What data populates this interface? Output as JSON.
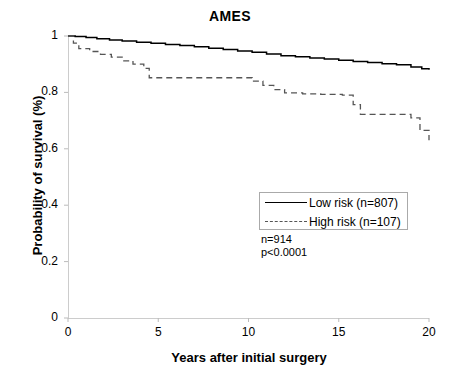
{
  "chart_data": {
    "type": "line",
    "title": "AMES",
    "xlabel": "Years after initial surgery",
    "ylabel": "Probability of survival (%)",
    "xlim": [
      0,
      20
    ],
    "ylim": [
      0,
      1
    ],
    "grid": false,
    "legend_position": "center-right",
    "xticks": [
      "0",
      "5",
      "10",
      "15",
      "20"
    ],
    "xtick_values": [
      0,
      5,
      10,
      15,
      20
    ],
    "yticks": [
      "0",
      "0.2",
      "0.4",
      "0.6",
      "0.8",
      "1"
    ],
    "ytick_values": [
      0,
      0.2,
      0.4,
      0.6,
      0.8,
      1
    ],
    "series": [
      {
        "name": "Low risk (n=807)",
        "style": "solid",
        "color": "#000000",
        "x": [
          0,
          0.4,
          1.0,
          1.6,
          2.3,
          3.0,
          3.8,
          4.6,
          5.4,
          6.2,
          7.0,
          7.8,
          8.6,
          9.4,
          10.2,
          11.0,
          11.8,
          12.6,
          13.4,
          14.2,
          15.0,
          15.8,
          16.6,
          17.4,
          18.2,
          19.0,
          19.6,
          20.0
        ],
        "y": [
          1.0,
          0.998,
          0.995,
          0.99,
          0.986,
          0.982,
          0.978,
          0.974,
          0.97,
          0.966,
          0.962,
          0.957,
          0.952,
          0.947,
          0.942,
          0.936,
          0.93,
          0.926,
          0.922,
          0.918,
          0.914,
          0.91,
          0.906,
          0.902,
          0.898,
          0.89,
          0.884,
          0.88
        ]
      },
      {
        "name": "High risk (n=107)",
        "style": "dashed",
        "color": "#555555",
        "x": [
          0,
          0.3,
          0.6,
          1.2,
          1.8,
          2.4,
          3.0,
          3.6,
          4.2,
          4.5,
          9.8,
          10.2,
          10.8,
          11.4,
          12.0,
          13.0,
          14.0,
          15.2,
          15.8,
          16.2,
          19.0,
          19.5,
          20.0
        ],
        "y": [
          1.0,
          0.975,
          0.955,
          0.945,
          0.935,
          0.925,
          0.912,
          0.9,
          0.885,
          0.852,
          0.852,
          0.84,
          0.825,
          0.81,
          0.798,
          0.795,
          0.793,
          0.79,
          0.757,
          0.722,
          0.71,
          0.665,
          0.63
        ]
      }
    ],
    "annotations": [
      {
        "text": "n=914",
        "x": 13.2,
        "y": 0.3
      },
      {
        "text": "p<0.0001",
        "x": 13.2,
        "y": 0.255
      }
    ]
  },
  "legend": {
    "entries": [
      {
        "label": "Low risk (n=807)",
        "style": "solid"
      },
      {
        "label": "High risk (n=107)",
        "style": "dashed"
      }
    ]
  }
}
